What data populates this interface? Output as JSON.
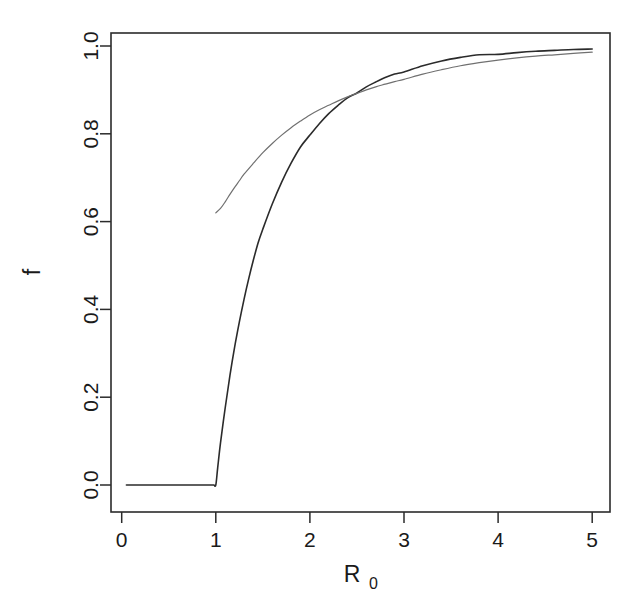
{
  "chart_data": {
    "type": "line",
    "title": "",
    "subtitle": "",
    "xlabel": "R_0",
    "xlabel_base": "R",
    "xlabel_subscript": "0",
    "ylabel": "f",
    "xlim": [
      0,
      5.2
    ],
    "ylim": [
      -0.03,
      1.04
    ],
    "grid": false,
    "legend_position": "none",
    "xticks": [
      0,
      1,
      2,
      3,
      4,
      5
    ],
    "xtick_labels": [
      "0",
      "1",
      "2",
      "3",
      "4",
      "5"
    ],
    "yticks": [
      0.0,
      0.2,
      0.4,
      0.6,
      0.8,
      1.0
    ],
    "ytick_labels": [
      "0.0",
      "0.2",
      "0.4",
      "0.6",
      "0.8",
      "1.0"
    ],
    "series": [
      {
        "name": "final epidemic size f",
        "color": "#2b2b2b",
        "width": 1.6,
        "x": [
          0.05,
          0.1,
          0.2,
          0.3,
          0.4,
          0.5,
          0.6,
          0.7,
          0.8,
          0.85,
          0.9,
          0.95,
          0.98,
          1.0,
          1.02,
          1.05,
          1.1,
          1.15,
          1.2,
          1.25,
          1.3,
          1.35,
          1.4,
          1.45,
          1.5,
          1.6,
          1.7,
          1.8,
          1.9,
          2.0,
          2.1,
          2.2,
          2.3,
          2.4,
          2.5,
          2.6,
          2.7,
          2.8,
          2.9,
          3.0,
          3.2,
          3.4,
          3.6,
          3.8,
          4.0,
          4.2,
          4.4,
          4.6,
          4.8,
          5.0
        ],
        "y": [
          0.0,
          0.0,
          0.0,
          0.0,
          0.0,
          0.0,
          0.0,
          0.0,
          0.0,
          0.0,
          0.0,
          0.0,
          0.0,
          0.0,
          0.039,
          0.096,
          0.176,
          0.249,
          0.314,
          0.371,
          0.423,
          0.47,
          0.513,
          0.552,
          0.583,
          0.64,
          0.69,
          0.733,
          0.77,
          0.797,
          0.823,
          0.846,
          0.865,
          0.882,
          0.893,
          0.907,
          0.918,
          0.928,
          0.936,
          0.941,
          0.955,
          0.966,
          0.974,
          0.98,
          0.981,
          0.985,
          0.988,
          0.99,
          0.992,
          0.993
        ]
      },
      {
        "name": "herd immunity threshold 1 - 1/R_0",
        "color": "#707070",
        "width": 1.2,
        "x": [
          1.0,
          1.05,
          1.1,
          1.15,
          1.2,
          1.25,
          1.3,
          1.4,
          1.5,
          1.6,
          1.7,
          1.8,
          1.9,
          2.0,
          2.1,
          2.2,
          2.3,
          2.4,
          2.5,
          2.6,
          2.7,
          2.8,
          2.9,
          3.0,
          3.2,
          3.4,
          3.6,
          3.8,
          4.0,
          4.2,
          4.4,
          4.6,
          4.8,
          5.0
        ],
        "y": [
          0.62,
          0.63,
          0.645,
          0.662,
          0.678,
          0.693,
          0.708,
          0.733,
          0.757,
          0.778,
          0.797,
          0.814,
          0.829,
          0.843,
          0.855,
          0.865,
          0.875,
          0.884,
          0.892,
          0.9,
          0.907,
          0.913,
          0.919,
          0.924,
          0.936,
          0.946,
          0.955,
          0.962,
          0.968,
          0.973,
          0.977,
          0.98,
          0.983,
          0.986
        ]
      }
    ],
    "annotations": []
  },
  "plot": {
    "background_color": "#ffffff",
    "axis_color": "#2b2b2b"
  }
}
